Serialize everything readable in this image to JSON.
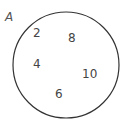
{
  "diagram": {
    "type": "venn",
    "set_label": "A",
    "elements": [
      "2",
      "8",
      "4",
      "10",
      "6"
    ],
    "stroke_color": "#333333"
  }
}
